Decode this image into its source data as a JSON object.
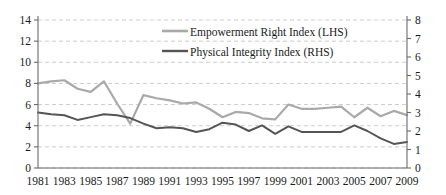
{
  "chart_data": {
    "type": "line",
    "title": "",
    "xlabel": "",
    "ylabel": "",
    "grid": true,
    "legend_position": "top-center",
    "x": [
      1981,
      1982,
      1983,
      1984,
      1985,
      1986,
      1987,
      1988,
      1989,
      1990,
      1991,
      1992,
      1993,
      1994,
      1995,
      1996,
      1997,
      1998,
      1999,
      2000,
      2001,
      2002,
      2003,
      2004,
      2005,
      2006,
      2007,
      2008,
      2009
    ],
    "xtick_labels": [
      "1981",
      "1983",
      "1985",
      "1987",
      "1989",
      "1991",
      "1993",
      "1995",
      "1997",
      "1999",
      "2001",
      "2003",
      "2005",
      "2007",
      "2009"
    ],
    "xlim": [
      1981,
      2009
    ],
    "left_axis": {
      "label": "Empowerment Right Index (LHS)",
      "ylim": [
        0,
        14
      ],
      "ticks": [
        0,
        2,
        4,
        6,
        8,
        10,
        12,
        14
      ],
      "tick_labels": [
        "0",
        "2",
        "4",
        "6",
        "8",
        "10",
        "12",
        "14"
      ]
    },
    "right_axis": {
      "label": "Physical Integrity Index (RHS)",
      "ylim": [
        0,
        8
      ],
      "ticks": [
        0,
        1,
        2,
        3,
        4,
        5,
        6,
        7,
        8
      ],
      "tick_labels": [
        "0",
        "1",
        "2",
        "3",
        "4",
        "5",
        "6",
        "7",
        "8"
      ]
    },
    "series": [
      {
        "name": "Empowerment Right Index (LHS)",
        "axis": "left",
        "color": "#a9a9a9",
        "values": [
          8.0,
          8.2,
          8.3,
          7.5,
          7.2,
          8.2,
          6.1,
          4.2,
          6.9,
          6.6,
          6.4,
          6.1,
          6.2,
          5.6,
          4.8,
          5.3,
          5.2,
          4.7,
          4.6,
          6.0,
          5.6,
          5.6,
          5.7,
          5.8,
          4.8,
          5.7,
          4.9,
          5.4,
          5.0
        ]
      },
      {
        "name": "Physical Integrity Index (RHS)",
        "axis": "right",
        "color": "#555555",
        "values": [
          3.0,
          2.9,
          2.85,
          2.6,
          2.75,
          2.9,
          2.85,
          2.7,
          2.4,
          2.15,
          2.2,
          2.15,
          1.95,
          2.1,
          2.45,
          2.35,
          2.0,
          2.3,
          1.85,
          2.25,
          1.95,
          1.95,
          1.95,
          1.95,
          2.3,
          2.0,
          1.6,
          1.3,
          1.4
        ]
      }
    ]
  },
  "legend": {
    "items": [
      {
        "label": "Empowerment Right Index (LHS)",
        "color": "#a9a9a9"
      },
      {
        "label": "Physical Integrity Index (RHS)",
        "color": "#555555"
      }
    ]
  }
}
